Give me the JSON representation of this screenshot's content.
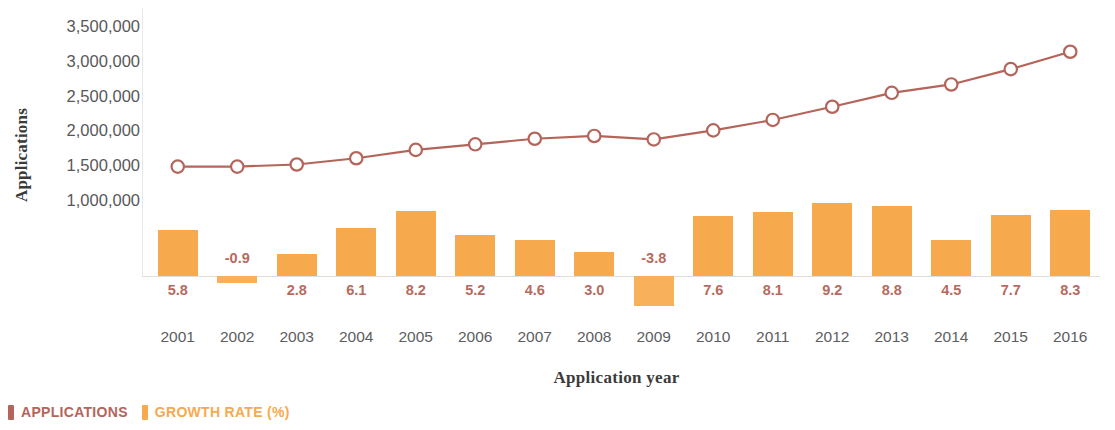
{
  "chart_data": {
    "type": "bar",
    "title": "",
    "xlabel": "Application year",
    "ylabel": "Applications",
    "categories": [
      "2001",
      "2002",
      "2003",
      "2004",
      "2005",
      "2006",
      "2007",
      "2008",
      "2009",
      "2010",
      "2011",
      "2012",
      "2013",
      "2014",
      "2015",
      "2016"
    ],
    "ylim": [
      1000000,
      3500000
    ],
    "yticks": [
      "1,000,000",
      "1,500,000",
      "2,000,000",
      "2,500,000",
      "3,000,000",
      "3,500,000"
    ],
    "ytick_values": [
      1000000,
      1500000,
      2000000,
      2500000,
      3000000,
      3500000
    ],
    "grid": false,
    "legend_position": "bottom-left",
    "series": [
      {
        "name": "APPLICATIONS",
        "type": "line",
        "color": "#b5645a",
        "marker": "open-circle",
        "values": [
          1480000,
          1480000,
          1510000,
          1600000,
          1720000,
          1800000,
          1880000,
          1920000,
          1870000,
          2000000,
          2150000,
          2340000,
          2540000,
          2660000,
          2880000,
          3130000
        ]
      },
      {
        "name": "GROWTH RATE (%)",
        "type": "bar",
        "color": "#f7a94e",
        "values": [
          5.8,
          -0.9,
          2.8,
          6.1,
          8.2,
          5.2,
          4.6,
          3.0,
          -3.8,
          7.6,
          8.1,
          9.2,
          8.8,
          4.5,
          7.7,
          8.3
        ],
        "labels": [
          "5.8",
          "-0.9",
          "2.8",
          "6.1",
          "8.2",
          "5.2",
          "4.6",
          "3.0",
          "-3.8",
          "7.6",
          "8.1",
          "9.2",
          "8.8",
          "4.5",
          "7.7",
          "8.3"
        ],
        "label_color": "#b76a5e"
      }
    ]
  },
  "legend": {
    "items": [
      {
        "label": "APPLICATIONS",
        "color": "#b5645a"
      },
      {
        "label": "GROWTH RATE (%)",
        "color": "#f7a94e"
      }
    ]
  },
  "axes": {
    "y_title": "Applications",
    "x_title": "Application year"
  }
}
